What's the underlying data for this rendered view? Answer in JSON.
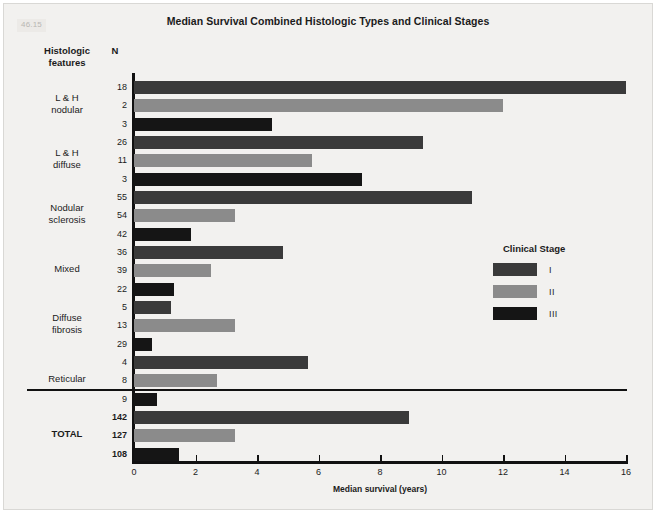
{
  "figure": {
    "number": "46.15",
    "title": "Median Survival Combined Histologic Types and Clinical Stages"
  },
  "headers": {
    "features_line1": "Histologic",
    "features_line2": "features",
    "n": "N"
  },
  "legend": {
    "title": "Clinical Stage",
    "items": [
      {
        "label": "I",
        "color": "#3a3a3a"
      },
      {
        "label": "II",
        "color": "#8b8b8b"
      },
      {
        "label": "III",
        "color": "#151515"
      }
    ]
  },
  "divider": {
    "present": true
  },
  "chart_data": {
    "type": "bar",
    "orientation": "horizontal",
    "title": "Median Survival Combined Histologic Types and Clinical Stages",
    "xlabel": "Median survival (years)",
    "ylabel": "Histologic features",
    "xlim": [
      0,
      16
    ],
    "xticks": [
      0,
      2,
      4,
      6,
      8,
      10,
      12,
      14,
      16
    ],
    "grid": false,
    "legend_title": "Clinical Stage",
    "legend_position": "center-right",
    "series": [
      {
        "name": "I",
        "color": "#3a3a3a"
      },
      {
        "name": "II",
        "color": "#8b8b8b"
      },
      {
        "name": "III",
        "color": "#151515"
      }
    ],
    "categories": [
      "L & H nodular",
      "L & H diffuse",
      "Nodular sclerosis",
      "Mixed",
      "Diffuse fibrosis",
      "Reticular",
      "TOTAL"
    ],
    "groups": [
      {
        "label_line1": "L & H",
        "label_line2": "nodular",
        "is_total": false,
        "bars": [
          {
            "stage": "I",
            "n": "18",
            "value": 16.0,
            "color": "#3a3a3a"
          },
          {
            "stage": "II",
            "n": "2",
            "value": 12.0,
            "color": "#8b8b8b"
          },
          {
            "stage": "III",
            "n": "3",
            "value": 4.5,
            "color": "#151515"
          }
        ]
      },
      {
        "label_line1": "L & H",
        "label_line2": "diffuse",
        "is_total": false,
        "bars": [
          {
            "stage": "I",
            "n": "26",
            "value": 9.4,
            "color": "#3a3a3a"
          },
          {
            "stage": "II",
            "n": "11",
            "value": 5.8,
            "color": "#8b8b8b"
          },
          {
            "stage": "III",
            "n": "3",
            "value": 7.4,
            "color": "#151515"
          }
        ]
      },
      {
        "label_line1": "Nodular",
        "label_line2": "sclerosis",
        "is_total": false,
        "bars": [
          {
            "stage": "I",
            "n": "55",
            "value": 11.0,
            "color": "#3a3a3a"
          },
          {
            "stage": "II",
            "n": "54",
            "value": 3.3,
            "color": "#8b8b8b"
          },
          {
            "stage": "III",
            "n": "42",
            "value": 1.85,
            "color": "#151515"
          }
        ]
      },
      {
        "label_line1": "Mixed",
        "label_line2": "",
        "is_total": false,
        "bars": [
          {
            "stage": "I",
            "n": "36",
            "value": 4.85,
            "color": "#3a3a3a"
          },
          {
            "stage": "II",
            "n": "39",
            "value": 2.5,
            "color": "#8b8b8b"
          },
          {
            "stage": "III",
            "n": "22",
            "value": 1.3,
            "color": "#151515"
          }
        ]
      },
      {
        "label_line1": "Diffuse",
        "label_line2": "fibrosis",
        "is_total": false,
        "bars": [
          {
            "stage": "I",
            "n": "5",
            "value": 1.2,
            "color": "#3a3a3a"
          },
          {
            "stage": "II",
            "n": "13",
            "value": 3.3,
            "color": "#8b8b8b"
          },
          {
            "stage": "III",
            "n": "29",
            "value": 0.6,
            "color": "#151515"
          }
        ]
      },
      {
        "label_line1": "Reticular",
        "label_line2": "",
        "is_total": false,
        "bars": [
          {
            "stage": "I",
            "n": "4",
            "value": 5.65,
            "color": "#3a3a3a"
          },
          {
            "stage": "II",
            "n": "8",
            "value": 2.7,
            "color": "#8b8b8b"
          },
          {
            "stage": "III",
            "n": "9",
            "value": 0.75,
            "color": "#151515"
          }
        ]
      },
      {
        "label_line1": "TOTAL",
        "label_line2": "",
        "is_total": true,
        "bars": [
          {
            "stage": "I",
            "n": "142",
            "value": 8.95,
            "color": "#3a3a3a"
          },
          {
            "stage": "II",
            "n": "127",
            "value": 3.3,
            "color": "#8b8b8b"
          },
          {
            "stage": "III",
            "n": "108",
            "value": 1.45,
            "color": "#151515"
          }
        ]
      }
    ]
  }
}
